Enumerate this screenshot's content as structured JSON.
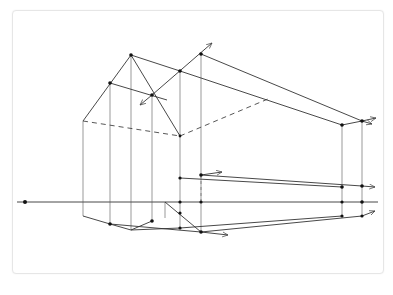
{
  "figure": {
    "kind": "two-point perspective sketch of a gabled house",
    "colors": {
      "line": "#333333",
      "point": "#111111",
      "card_border": "#e6e6e6",
      "background": "#ffffff"
    },
    "horizon_y": 202,
    "vanishing_point_left": [
      25,
      202
    ],
    "elements": {
      "horizon_line": "horizon-line",
      "ground_plane": "ground-plane",
      "walls": "wall-verticals",
      "roof": "gable-roof",
      "hidden_edges": "dashed-hidden-edges",
      "direction_arrows": "vanishing-direction-arrows"
    }
  }
}
